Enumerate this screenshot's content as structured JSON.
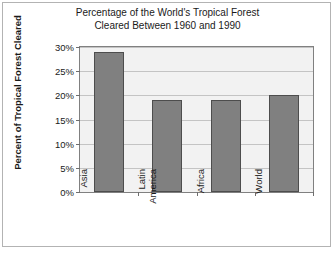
{
  "chart_data": {
    "type": "bar",
    "title": "Percentage of the World's Tropical Forest\nCleared Between 1960 and 1990",
    "categories": [
      "Asia",
      "Latin\nAmerica",
      "Africa",
      "World"
    ],
    "values": [
      29,
      19,
      19,
      20
    ],
    "xlabel": "",
    "ylabel": "Percent of Tropical Forest Cleared",
    "ylim": [
      0,
      30
    ],
    "ytick_values": [
      0,
      5,
      10,
      15,
      20,
      25,
      30
    ],
    "ytick_labels": [
      "0%",
      "5%",
      "10%",
      "15%",
      "20%",
      "25%",
      "30%"
    ],
    "grid": true,
    "legend": "none",
    "bar_color": "#808080",
    "bar_edge_color": "#4d4d4d",
    "plot_background": "#f2f2f2",
    "gridline_color": "#c4c4c4",
    "frame_color": "#b3b3b3"
  }
}
